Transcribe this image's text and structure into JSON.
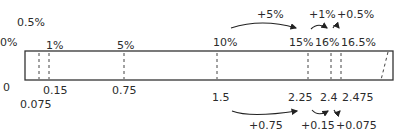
{
  "diagram": {
    "bar": {
      "left": 25,
      "right": 393,
      "top": 51,
      "bottom": 80,
      "stroke": "#333333"
    },
    "top_labels": [
      {
        "text": "0.5%",
        "x": 17,
        "y": 17
      },
      {
        "text": "0%",
        "x": 0,
        "y": 37
      },
      {
        "text": "1%",
        "x": 47,
        "y": 40
      },
      {
        "text": "5%",
        "x": 118,
        "y": 40
      },
      {
        "text": "10%",
        "x": 214,
        "y": 37
      },
      {
        "text": "15%",
        "x": 290,
        "y": 37
      },
      {
        "text": "16%",
        "x": 316,
        "y": 37
      },
      {
        "text": "16.5%",
        "x": 342,
        "y": 37
      }
    ],
    "top_increments": [
      {
        "text": "+5%",
        "x": 258,
        "y": 9
      },
      {
        "text": "+1%",
        "x": 310,
        "y": 9
      },
      {
        "text": "+0.5%",
        "x": 338,
        "y": 9
      }
    ],
    "bottom_labels": [
      {
        "text": "0",
        "x": 4,
        "y": 82
      },
      {
        "text": "0.15",
        "x": 43,
        "y": 85
      },
      {
        "text": "0.75",
        "x": 112,
        "y": 85
      },
      {
        "text": "0.075",
        "x": 21,
        "y": 98
      },
      {
        "text": "1.5",
        "x": 213,
        "y": 92
      },
      {
        "text": "2.25",
        "x": 289,
        "y": 92
      },
      {
        "text": "2.4",
        "x": 321,
        "y": 92
      },
      {
        "text": "2.475",
        "x": 343,
        "y": 92
      }
    ],
    "bottom_increments": [
      {
        "text": "+0.75",
        "x": 249,
        "y": 120
      },
      {
        "text": "+0.15",
        "x": 302,
        "y": 120
      },
      {
        "text": "+0.075",
        "x": 337,
        "y": 120
      }
    ],
    "dashed_lines_x": [
      39,
      49,
      124,
      217,
      308,
      331,
      341
    ],
    "slanted_dashed_line": {
      "x1": 388,
      "y1": 52,
      "x2": 381,
      "y2": 80
    }
  }
}
